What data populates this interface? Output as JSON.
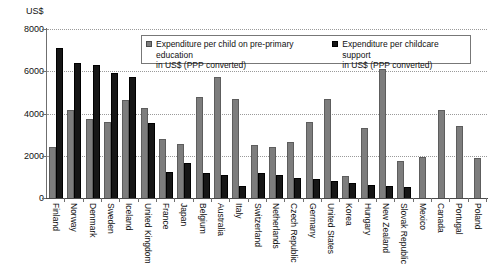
{
  "chart_data": {
    "type": "bar",
    "title": "",
    "xlabel": "",
    "ylabel": "US$",
    "ylim": [
      0,
      8000
    ],
    "yticks": [
      0,
      2000,
      4000,
      6000,
      8000
    ],
    "ytick_labels": [
      "0",
      "2000",
      "4000",
      "6000",
      "8000"
    ],
    "grid": true,
    "legend_position": "top-center",
    "orientation": "vertical",
    "grouped": true,
    "categories": [
      "Finland",
      "Norway",
      "Denmark",
      "Sweden",
      "Iceland",
      "United Kingdom",
      "France",
      "Japan",
      "Belgium",
      "Australia",
      "Italy",
      "Switzerland",
      "Netherlands",
      "Czech Republic",
      "Germany",
      "United States",
      "Korea",
      "Hungary",
      "New Zealand",
      "Slovak Republic",
      "Mexico",
      "Canada",
      "Portugal",
      "Poland"
    ],
    "series": [
      {
        "name": "Expenditure per child on pre-primary education in US$ (PPP converted)",
        "color": "#7d7d7d",
        "values": [
          2400,
          4150,
          3750,
          3600,
          4650,
          4250,
          2800,
          2550,
          4800,
          5750,
          4700,
          2500,
          2400,
          2650,
          3600,
          4700,
          1050,
          3300,
          6100,
          1750,
          1950,
          4150,
          3400,
          1900
        ]
      },
      {
        "name": "Expenditure per childcare support in US$ (PPP converted)",
        "color": "#161616",
        "values": [
          7100,
          6400,
          6300,
          5900,
          5750,
          3550,
          1250,
          1650,
          1200,
          1100,
          550,
          1200,
          1100,
          950,
          900,
          800,
          700,
          600,
          550,
          500,
          0,
          0,
          0,
          0
        ]
      }
    ]
  },
  "legend": {
    "items": [
      {
        "marker": "series-0-swatch",
        "line1": "Expenditure per child on pre-primary education",
        "line2": "in US$ (PPP converted)"
      },
      {
        "marker": "series-1-swatch",
        "line1": "Expenditure per childcare support",
        "line2": "in US$ (PPP converted)"
      }
    ]
  },
  "axis": {
    "unit_caption": "US$"
  }
}
